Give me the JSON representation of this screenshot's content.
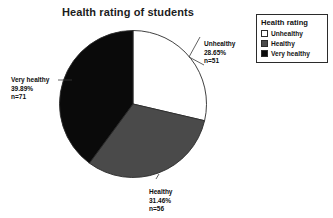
{
  "chart_data": {
    "type": "pie",
    "title": "Health rating of students",
    "xlabel": "",
    "ylabel": "",
    "legend_position": "top-right",
    "grid": false,
    "total_n": 178,
    "categories": [
      "Unhealthy",
      "Healthy",
      "Very healthy"
    ],
    "values": [
      28.65,
      31.46,
      39.89
    ],
    "counts": [
      51,
      56,
      71
    ],
    "start_angle_deg": 0,
    "direction": "clockwise",
    "slices": [
      {
        "label": "Unhealthy",
        "percent": 28.65,
        "percent_text": "28.65%",
        "count": 51,
        "count_text": "n=51",
        "color": "#ffffff",
        "stroke": "#2b2b2b",
        "start_deg": 0,
        "end_deg": 103.14
      },
      {
        "label": "Healthy",
        "percent": 31.46,
        "percent_text": "31.46%",
        "count": 56,
        "count_text": "n=56",
        "color": "#4a4a4a",
        "stroke": "#2b2b2b",
        "start_deg": 103.14,
        "end_deg": 216.4
      },
      {
        "label": "Very healthy",
        "percent": 39.89,
        "percent_text": "39.89%",
        "count": 71,
        "count_text": "n=71",
        "color": "#0a0a0a",
        "stroke": "#2b2b2b",
        "start_deg": 216.4,
        "end_deg": 360
      }
    ]
  },
  "title": "Health rating of students",
  "callouts": {
    "unhealthy": {
      "category": "Unhealthy",
      "percent": "28.65%",
      "count": "n=51"
    },
    "healthy": {
      "category": "Healthy",
      "percent": "31.46%",
      "count": "n=56"
    },
    "very_healthy": {
      "category": "Very healthy",
      "percent": "39.89%",
      "count": "n=71"
    }
  },
  "legend": {
    "title": "Health rating",
    "items": [
      {
        "label": "Unhealthy",
        "color": "#ffffff"
      },
      {
        "label": "Healthy",
        "color": "#4a4a4a"
      },
      {
        "label": "Very healthy",
        "color": "#0a0a0a"
      }
    ]
  },
  "colors": {
    "unhealthy": "#ffffff",
    "healthy": "#4a4a4a",
    "very_healthy": "#0a0a0a",
    "outline": "#2b2b2b",
    "text": "#111111",
    "background": "#ffffff"
  }
}
